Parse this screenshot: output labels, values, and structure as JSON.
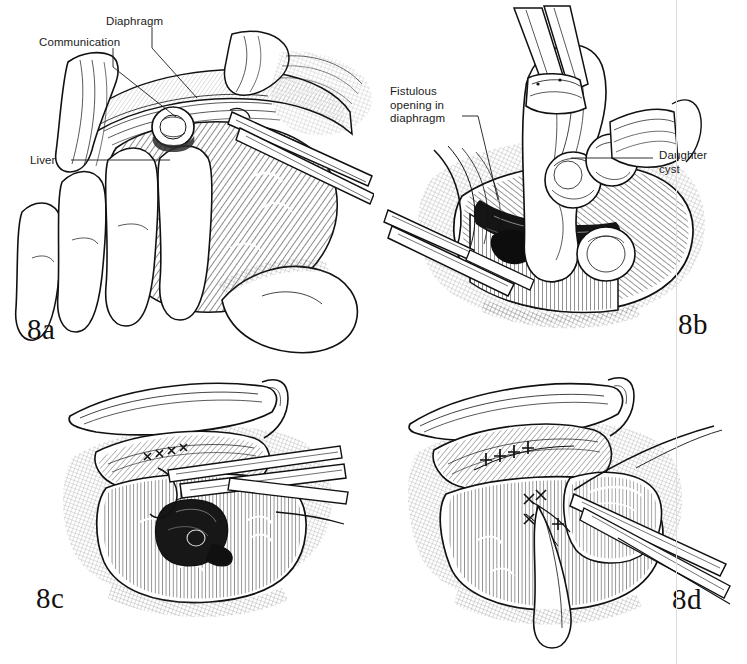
{
  "figure": {
    "background_color": "#ffffff",
    "ink_color": "#111111",
    "label_color": "#1a1a1a",
    "style": "pen-and-ink line drawing with cross-hatching"
  },
  "panels": [
    {
      "id": "8a",
      "number": "8a",
      "caption": "Operative exposure showing liver dome, diaphragm and the cyst communication; surgeon's hand retracts the liver while a retractor elevates the diaphragm.",
      "labels": [
        {
          "name": "communication",
          "text": "Communication"
        },
        {
          "name": "diaphragm",
          "text": "Diaphragm"
        },
        {
          "name": "liver",
          "text": "Liver"
        }
      ]
    },
    {
      "id": "8b",
      "number": "8b",
      "caption": "Daughter cysts being delivered through the fistulous opening in the diaphragm with forceps.",
      "labels": [
        {
          "name": "fistulous-opening",
          "text": "Fistulous\nopening in\ndiaphragm"
        },
        {
          "name": "daughter-cyst",
          "text": "Daughter\ncyst"
        }
      ]
    },
    {
      "id": "8c",
      "number": "8c",
      "caption": "Residual cyst cavity in the liver after evacuation; diaphragmatic defect closed with interrupted sutures.",
      "labels": []
    },
    {
      "id": "8d",
      "number": "8d",
      "caption": "Completed repair with sutured diaphragm and drainage of the residual cavity.",
      "labels": []
    }
  ],
  "page_artifact": {
    "name": "scan-page-edge",
    "color": "#dcdcdc"
  }
}
